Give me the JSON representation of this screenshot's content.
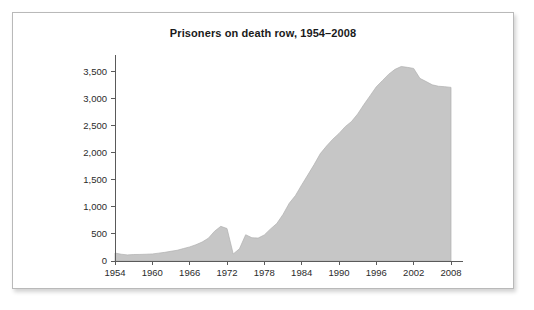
{
  "figure": {
    "title": "Prisoners on death row, 1954–2008",
    "border_color": "#b9b9b9",
    "background": "#ffffff"
  },
  "chart_data": {
    "type": "area",
    "title": "Prisoners on death row, 1954–2008",
    "xlabel": "",
    "ylabel": "",
    "xlim": [
      1954,
      2008
    ],
    "ylim": [
      0,
      3750
    ],
    "grid": false,
    "legend": null,
    "fill_color": "#c6c6c6",
    "line_color": "#b0b0b0",
    "axis_color": "#5a5a5a",
    "x_ticks": [
      1954,
      1960,
      1966,
      1972,
      1978,
      1984,
      1990,
      1996,
      2002,
      2008
    ],
    "x_tick_labels": [
      "1954",
      "1960",
      "1966",
      "1972",
      "1978",
      "1984",
      "1990",
      "1996",
      "2002",
      "2008"
    ],
    "y_ticks": [
      0,
      500,
      1000,
      1500,
      2000,
      2500,
      3000,
      3500
    ],
    "y_tick_labels": [
      "0",
      "500",
      "1,000",
      "1,500",
      "2,000",
      "2,500",
      "3,000",
      "3,500"
    ],
    "series": [
      {
        "name": "Prisoners on death row",
        "x": [
          1954,
          1955,
          1956,
          1957,
          1958,
          1959,
          1960,
          1961,
          1962,
          1963,
          1964,
          1965,
          1966,
          1967,
          1968,
          1969,
          1970,
          1971,
          1972,
          1973,
          1974,
          1975,
          1976,
          1977,
          1978,
          1979,
          1980,
          1981,
          1982,
          1983,
          1984,
          1985,
          1986,
          1987,
          1988,
          1989,
          1990,
          1991,
          1992,
          1993,
          1994,
          1995,
          1996,
          1997,
          1998,
          1999,
          2000,
          2001,
          2002,
          2003,
          2004,
          2005,
          2006,
          2007,
          2008
        ],
        "values": [
          147,
          125,
          113,
          120,
          121,
          125,
          130,
          145,
          160,
          180,
          198,
          230,
          260,
          300,
          350,
          420,
          550,
          640,
          600,
          130,
          225,
          485,
          430,
          423,
          482,
          593,
          692,
          860,
          1066,
          1209,
          1405,
          1591,
          1781,
          1984,
          2124,
          2250,
          2356,
          2482,
          2575,
          2716,
          2890,
          3054,
          3219,
          3335,
          3452,
          3540,
          3593,
          3577,
          3557,
          3374,
          3315,
          3254,
          3228,
          3220,
          3207
        ]
      }
    ]
  },
  "axes": {
    "y_axis_name": "y-axis",
    "x_axis_name": "x-axis"
  }
}
